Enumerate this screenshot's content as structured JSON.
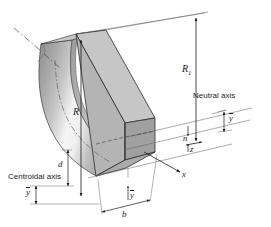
{
  "figure": {
    "kind": "engineering-line-drawing",
    "canvas": {
      "width": 271,
      "height": 227,
      "background": "#ffffff"
    },
    "colors": {
      "line": "#1a1a1a",
      "thin_line": "#555555",
      "face_front": "#b9b9b9",
      "face_side": "#9a9a9a",
      "face_top": "#c9c9c9",
      "body_dark": "#8f8f8f",
      "body_light": "#f2f2f2",
      "text": "#1a1a1a"
    }
  },
  "labels": {
    "outer_radius": "R",
    "outer_radius_sub": "1",
    "centroidal_radius": "R",
    "neutral_axis": "Neutral axis",
    "centroidal_axis": "Centroidal axis",
    "neutral_axis_point": "n",
    "axis_x": "x",
    "axis_y": "y",
    "axis_z": "z",
    "depth": "d",
    "width": "b",
    "centroid_offset_left": "y",
    "centroid_offset_bottom": "y",
    "neutral_offset_right": "y"
  },
  "dimensions": {
    "R1": {
      "label": "R",
      "subscript": "1",
      "meaning": "radius to outer surface"
    },
    "R": {
      "label": "R",
      "meaning": "radius to centroidal axis"
    },
    "d": {
      "label": "d",
      "meaning": "depth of rectangular section"
    },
    "b": {
      "label": "b",
      "meaning": "width of rectangular section"
    },
    "ybar": {
      "label": "y",
      "overbar": true,
      "meaning": "distance from neutral axis"
    }
  }
}
